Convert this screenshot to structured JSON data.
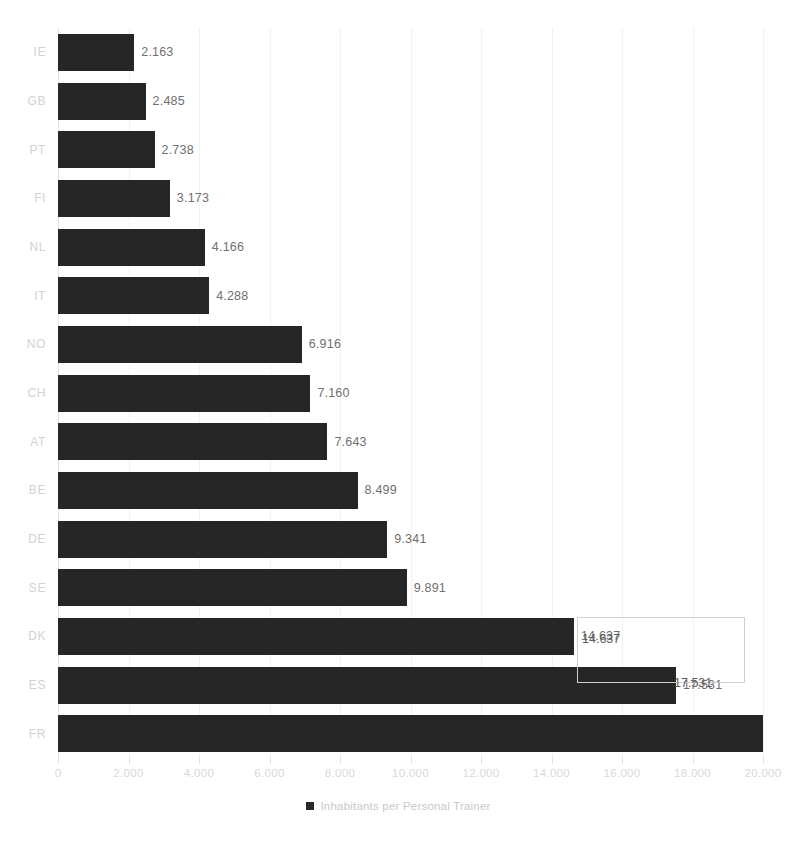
{
  "chart_data": {
    "type": "bar",
    "orientation": "horizontal",
    "title": "",
    "xlabel": "",
    "ylabel": "",
    "xlim": [
      0,
      20000
    ],
    "grid": true,
    "legend_position": "bottom",
    "legend": [
      "Inhabitants per Personal Trainer"
    ],
    "categories": [
      "IE",
      "GB",
      "PT",
      "FI",
      "NL",
      "IT",
      "NO",
      "CH",
      "AT",
      "BE",
      "DE",
      "SE",
      "DK",
      "ES",
      "FR"
    ],
    "values": [
      2163,
      2485,
      2738,
      3173,
      4166,
      4288,
      6916,
      7160,
      7643,
      8499,
      9341,
      9891,
      14637,
      17531,
      20000
    ],
    "value_labels": [
      "2.163",
      "2.485",
      "2.738",
      "3.173",
      "4.166",
      "4.288",
      "6.916",
      "7.160",
      "7.643",
      "8.499",
      "9.341",
      "9.891",
      "14.637",
      "17.531",
      ""
    ],
    "xticks": [
      0,
      2000,
      4000,
      6000,
      8000,
      10000,
      12000,
      14000,
      16000,
      18000,
      20000
    ],
    "xtick_labels": [
      "0",
      "2.000",
      "4.000",
      "6.000",
      "8.000",
      "10.000",
      "12.000",
      "14.000",
      "16.000",
      "18.000",
      "20.000"
    ],
    "series": [
      {
        "name": "Inhabitants per Personal Trainer",
        "color": "#262626",
        "values": [
          2163,
          2485,
          2738,
          3173,
          4166,
          4288,
          6916,
          7160,
          7643,
          8499,
          9341,
          9891,
          14637,
          17531,
          20000
        ]
      }
    ]
  },
  "legend": {
    "swatch_color": "#2b2b2b",
    "label": "Inhabitants per Personal Trainer"
  },
  "selection": {
    "present": true,
    "border_color": "#cfcfcf",
    "labels": [
      "14.637",
      "17.531"
    ]
  },
  "colors": {
    "bar": "#262626",
    "gridline": "#f2f2f2",
    "axis_text": "#d9d9d9",
    "category_text": "#d2d2d2",
    "data_label_text": "#6f6f6f",
    "background": "#ffffff"
  }
}
